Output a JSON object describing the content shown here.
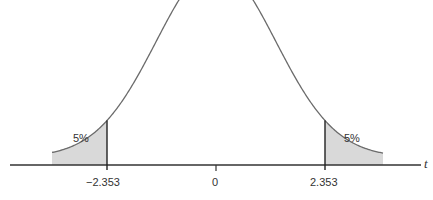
{
  "chart_data": {
    "type": "area",
    "title": "",
    "distribution": "Student t distribution (two-tailed rejection regions)",
    "xlabel": "t",
    "ylabel": "",
    "tick_labels": [
      "−2.353",
      "0",
      "2.353"
    ],
    "tick_values": [
      -2.353,
      0,
      2.353
    ],
    "shaded_regions": [
      {
        "side": "left",
        "from": "-inf",
        "to": -2.353,
        "label": "5%",
        "area": 0.05
      },
      {
        "side": "right",
        "from": 2.353,
        "to": "inf",
        "label": "5%",
        "area": 0.05
      }
    ],
    "grid": false,
    "legend": null
  },
  "labels": {
    "left_tail": "5%",
    "right_tail": "5%",
    "tick_left": "−2.353",
    "tick_center": "0",
    "tick_right": "2.353",
    "axis_var": "t"
  },
  "colors": {
    "curve": "#6b6b6b",
    "axis": "#333333",
    "shade": "#d9d9d9"
  }
}
